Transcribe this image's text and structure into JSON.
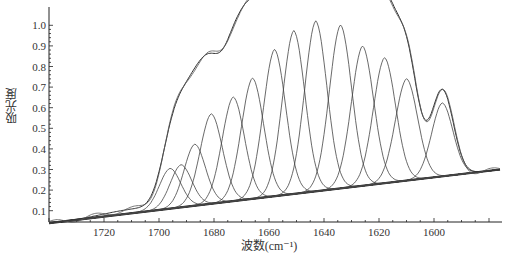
{
  "chart_data": {
    "type": "line",
    "title": "",
    "xlabel": "波数(cm⁻¹)",
    "ylabel": "吸光度",
    "xlim": [
      1740,
      1576
    ],
    "ylim": [
      0.05,
      1.05
    ],
    "x_reversed": true,
    "grid": false,
    "legend": null,
    "x_ticks": [
      1720,
      1700,
      1680,
      1660,
      1640,
      1620,
      1600
    ],
    "y_ticks": [
      0.1,
      0.2,
      0.3,
      0.4,
      0.5,
      0.6,
      0.7,
      0.8,
      0.9,
      1.0
    ],
    "baseline": {
      "x": [
        1740,
        1576
      ],
      "y": [
        0.04,
        0.3
      ]
    },
    "fitted_component_peaks": [
      {
        "center": 1696,
        "height": 0.17,
        "width": 4.0
      },
      {
        "center": 1692,
        "height": 0.18,
        "width": 4.0
      },
      {
        "center": 1687,
        "height": 0.26,
        "width": 4.0
      },
      {
        "center": 1681,
        "height": 0.38,
        "width": 4.2
      },
      {
        "center": 1673,
        "height": 0.44,
        "width": 4.2
      },
      {
        "center": 1666,
        "height": 0.51,
        "width": 4.2
      },
      {
        "center": 1658,
        "height": 0.62,
        "width": 4.2
      },
      {
        "center": 1651,
        "height": 0.69,
        "width": 4.2
      },
      {
        "center": 1643,
        "height": 0.72,
        "width": 4.2
      },
      {
        "center": 1634,
        "height": 0.69,
        "width": 4.2
      },
      {
        "center": 1626,
        "height": 0.59,
        "width": 4.2
      },
      {
        "center": 1618,
        "height": 0.53,
        "width": 4.2
      },
      {
        "center": 1610,
        "height": 0.43,
        "width": 4.2
      },
      {
        "center": 1597,
        "height": 0.31,
        "width": 4.0
      }
    ],
    "series": [
      {
        "name": "measured spectrum",
        "note": "broad amide I band, max ≈1.01 near 1650–1643 cm⁻¹"
      },
      {
        "name": "fitted envelope (sum of components)"
      },
      {
        "name": "baseline"
      }
    ]
  },
  "colors": {
    "line": "#333333",
    "axis": "#222222",
    "background": "#ffffff"
  }
}
